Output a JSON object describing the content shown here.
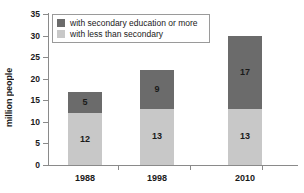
{
  "chart_data": {
    "type": "bar",
    "stacked": true,
    "title": "",
    "subtitle": "",
    "xlabel": "",
    "ylabel": "million people",
    "categories": [
      "1988",
      "1998",
      "2010"
    ],
    "series": [
      {
        "name": "with less than secondary",
        "color": "#c8c8c8",
        "values": [
          12,
          13,
          13
        ]
      },
      {
        "name": "with secondary education or more",
        "color": "#6b6b6b",
        "values": [
          5,
          9,
          17
        ]
      }
    ],
    "totals": [
      17,
      22,
      30
    ],
    "ylim": [
      0,
      35
    ],
    "yticks": [
      0,
      5,
      10,
      15,
      20,
      25,
      30,
      35
    ],
    "ytick_labels": [
      "0",
      "5",
      "10",
      "15",
      "20",
      "25",
      "30",
      "35"
    ],
    "grid": false,
    "legend_position": "top-left-inside",
    "legend_entries": [
      "with secondary education or more",
      "with less than secondary"
    ]
  },
  "colors": {
    "dark": "#6b6b6b",
    "light": "#c8c8c8",
    "axis": "#8a8a8a",
    "text": "#1a1a1a",
    "background": "#ffffff",
    "legend_border": "#9a9a9a"
  },
  "legend": {
    "items": [
      {
        "label": "with secondary education or more",
        "color": "#6b6b6b"
      },
      {
        "label": "with less than secondary",
        "color": "#c8c8c8"
      }
    ]
  },
  "axes": {
    "y": {
      "label": "million people",
      "ticks": [
        "35",
        "30",
        "25",
        "20",
        "15",
        "10",
        "5",
        "0"
      ]
    },
    "x": {
      "ticks": [
        "1988",
        "1998",
        "2010"
      ]
    }
  },
  "bars": [
    {
      "category": "1988",
      "light_value": "12",
      "dark_value": "5"
    },
    {
      "category": "1998",
      "light_value": "13",
      "dark_value": "9"
    },
    {
      "category": "2010",
      "light_value": "13",
      "dark_value": "17"
    }
  ]
}
